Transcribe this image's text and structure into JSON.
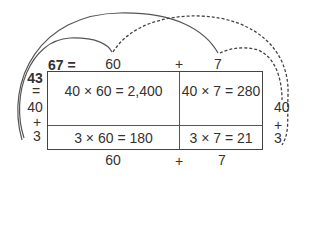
{
  "diagram": {
    "type": "area-model-multiplication",
    "expression": "67 × 43",
    "top_header": {
      "total": "67 =",
      "part1": "60",
      "plus": "+",
      "part2": "7"
    },
    "left_labels": {
      "total": "43",
      "equals": "=",
      "part1": "40",
      "plus": "+",
      "part2": "3"
    },
    "right_labels": {
      "part1": "40",
      "plus": "+",
      "part2": "3"
    },
    "bottom_labels": {
      "part1": "60",
      "plus": "+",
      "part2": "7"
    },
    "cells": {
      "top_left": "40 × 60 = 2,400",
      "top_right": "40 × 7 = 280",
      "bottom_left": "3 × 60 = 180",
      "bottom_right": "3 × 7 = 21"
    },
    "arcs": [
      {
        "style": "solid",
        "from": "43",
        "to": "60"
      },
      {
        "style": "solid",
        "from": "43",
        "to": "7"
      },
      {
        "style": "dashed",
        "from": "60",
        "to": "3"
      },
      {
        "style": "dashed",
        "from": "7",
        "to": "40"
      }
    ],
    "colors": {
      "ink": "#333333",
      "line": "#444444",
      "background": "#ffffff"
    }
  }
}
